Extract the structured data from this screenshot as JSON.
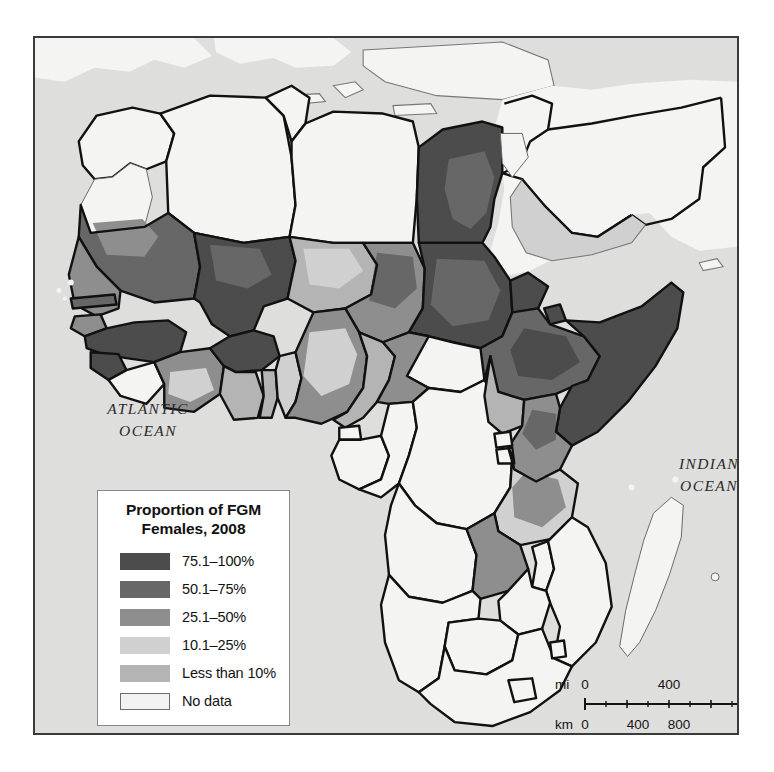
{
  "map": {
    "title_region": "Africa",
    "background_color": "#dededc",
    "border_color": "#3b3b3b",
    "ocean_labels": [
      {
        "name": "atlantic-ocean",
        "text": "ATLANTIC\nOCEAN"
      },
      {
        "name": "indian-ocean",
        "text": "INDIAN\nOCEAN"
      }
    ]
  },
  "legend": {
    "title": "Proportion of FGM\nFemales, 2008",
    "entries": [
      {
        "label": "75.1–100%",
        "color": "#4c4c4c",
        "outlined": false
      },
      {
        "label": "50.1–75%",
        "color": "#676767",
        "outlined": false
      },
      {
        "label": "25.1–50%",
        "color": "#8e8e8e",
        "outlined": false
      },
      {
        "label": "10.1–25%",
        "color": "#d0d0d0",
        "outlined": false
      },
      {
        "label": "Less than 10%",
        "color": "#b4b4b4",
        "outlined": false
      },
      {
        "label": "No data",
        "color": "#f3f3f1",
        "outlined": true
      }
    ]
  },
  "scale_bar": {
    "miles": {
      "unit": "mi",
      "ticks": [
        "0",
        "400",
        "800"
      ]
    },
    "kilometers": {
      "unit": "km",
      "ticks": [
        "0",
        "400",
        "800"
      ]
    }
  },
  "chart_data": {
    "type": "choropleth-map",
    "title": "Proportion of FGM Females, 2008",
    "region": "Africa and adjacent Middle East",
    "value_unit": "percent",
    "classes": [
      {
        "label": "75.1–100%",
        "min": 75.1,
        "max": 100,
        "color": "#4c4c4c"
      },
      {
        "label": "50.1–75%",
        "min": 50.1,
        "max": 75,
        "color": "#676767"
      },
      {
        "label": "25.1–50%",
        "min": 25.1,
        "max": 50,
        "color": "#8e8e8e"
      },
      {
        "label": "10.1–25%",
        "min": 10.1,
        "max": 25,
        "color": "#d0d0d0"
      },
      {
        "label": "Less than 10%",
        "min": 0,
        "max": 10,
        "color": "#b4b4b4"
      },
      {
        "label": "No data",
        "min": null,
        "max": null,
        "color": "#f3f3f1"
      }
    ],
    "countries": [
      {
        "name": "Morocco",
        "class": "No data"
      },
      {
        "name": "Western Sahara",
        "class": "No data"
      },
      {
        "name": "Algeria",
        "class": "No data"
      },
      {
        "name": "Tunisia",
        "class": "No data"
      },
      {
        "name": "Libya",
        "class": "No data"
      },
      {
        "name": "Egypt",
        "class": "75.1–100%"
      },
      {
        "name": "Mauritania",
        "class": "50.1–75%"
      },
      {
        "name": "Mali",
        "class": "75.1–100%"
      },
      {
        "name": "Niger",
        "class": "Less than 10%"
      },
      {
        "name": "Chad",
        "class": "25.1–50%"
      },
      {
        "name": "Sudan",
        "class": "75.1–100%"
      },
      {
        "name": "South Sudan",
        "class": "No data"
      },
      {
        "name": "Eritrea",
        "class": "75.1–100%"
      },
      {
        "name": "Djibouti",
        "class": "75.1–100%"
      },
      {
        "name": "Ethiopia",
        "class": "50.1–75%"
      },
      {
        "name": "Somalia",
        "class": "75.1–100%"
      },
      {
        "name": "Senegal",
        "class": "25.1–50%"
      },
      {
        "name": "Gambia",
        "class": "50.1–75%"
      },
      {
        "name": "Guinea-Bissau",
        "class": "25.1–50%"
      },
      {
        "name": "Guinea",
        "class": "75.1–100%"
      },
      {
        "name": "Sierra Leone",
        "class": "75.1–100%"
      },
      {
        "name": "Liberia",
        "class": "50.1–75%"
      },
      {
        "name": "Côte d'Ivoire",
        "class": "25.1–50%"
      },
      {
        "name": "Burkina Faso",
        "class": "75.1–100%"
      },
      {
        "name": "Ghana",
        "class": "Less than 10%"
      },
      {
        "name": "Togo",
        "class": "Less than 10%"
      },
      {
        "name": "Benin",
        "class": "10.1–25%"
      },
      {
        "name": "Nigeria",
        "class": "25.1–50%"
      },
      {
        "name": "Cameroon",
        "class": "Less than 10%"
      },
      {
        "name": "Central African Republic",
        "class": "25.1–50%"
      },
      {
        "name": "Gabon",
        "class": "No data"
      },
      {
        "name": "Congo",
        "class": "No data"
      },
      {
        "name": "Dem. Rep. Congo",
        "class": "No data"
      },
      {
        "name": "Uganda",
        "class": "Less than 10%"
      },
      {
        "name": "Kenya",
        "class": "25.1–50%"
      },
      {
        "name": "Tanzania",
        "class": "10.1–25%"
      },
      {
        "name": "Rwanda",
        "class": "No data"
      },
      {
        "name": "Burundi",
        "class": "No data"
      },
      {
        "name": "Zambia",
        "class": "No data"
      },
      {
        "name": "Angola",
        "class": "No data"
      },
      {
        "name": "Namibia",
        "class": "No data"
      },
      {
        "name": "Botswana",
        "class": "No data"
      },
      {
        "name": "Zimbabwe",
        "class": "No data"
      },
      {
        "name": "Mozambique",
        "class": "No data"
      },
      {
        "name": "Malawi",
        "class": "No data"
      },
      {
        "name": "South Africa",
        "class": "No data"
      },
      {
        "name": "Lesotho",
        "class": "No data"
      },
      {
        "name": "Swaziland",
        "class": "No data"
      },
      {
        "name": "Madagascar",
        "class": "No data"
      },
      {
        "name": "Yemen",
        "class": "10.1–25%"
      },
      {
        "name": "Saudi Arabia",
        "class": "No data"
      },
      {
        "name": "Oman",
        "class": "No data"
      },
      {
        "name": "Iraq",
        "class": "No data"
      },
      {
        "name": "Turkey",
        "class": "No data"
      },
      {
        "name": "Syria",
        "class": "No data"
      },
      {
        "name": "Israel",
        "class": "No data"
      },
      {
        "name": "Jordan",
        "class": "No data"
      }
    ]
  }
}
